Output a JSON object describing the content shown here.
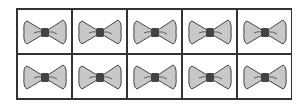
{
  "frame": {
    "rows": 2,
    "columns": 5,
    "item": "bow-tie",
    "count": 10,
    "colors": {
      "wing": "#c8c8c8",
      "knot": "#444444",
      "outline": "#444444",
      "border": "#333333"
    }
  }
}
